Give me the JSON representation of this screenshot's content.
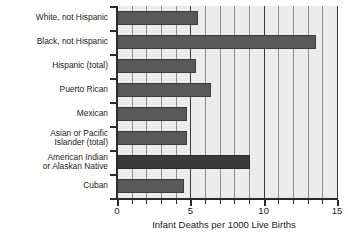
{
  "chart_data": {
    "type": "bar",
    "orientation": "horizontal",
    "title": "",
    "xlabel": "Infant Deaths per 1000 Live Births",
    "ylabel": "",
    "xlim": [
      0,
      15
    ],
    "xticks": [
      0,
      5,
      10,
      15
    ],
    "xticklabels": [
      "0",
      "5",
      "10",
      "15"
    ],
    "minor_gridlines": true,
    "minor_tick_interval": 1,
    "grid": true,
    "legend": "none",
    "categories": [
      "White, not Hispanic",
      "Black, not Hispanic",
      "Hispanic (total)",
      "Puerto Rican",
      "Mexican",
      "Asian or Pacific\nIslander (total)",
      "American Indian\nor Alaskan Native",
      "Cuban"
    ],
    "values": [
      5.5,
      13.6,
      5.4,
      6.4,
      4.8,
      4.8,
      9.1,
      4.6
    ],
    "bar_colors": [
      "#595959",
      "#595959",
      "#595959",
      "#595959",
      "#595959",
      "#595959",
      "#3a3a3a",
      "#595959"
    ],
    "plot_background": "#ececec",
    "gridline_color": "#8c8c8c",
    "axis_color": "#2b2b2b"
  }
}
